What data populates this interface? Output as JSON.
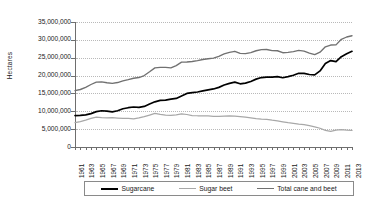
{
  "chart_data": {
    "type": "line",
    "title": "",
    "xlabel": "",
    "ylabel": "Hectares",
    "ylim": [
      0,
      35000000
    ],
    "xlim": [
      1961,
      2013
    ],
    "grid": true,
    "legend_position": "bottom",
    "y_ticks": [
      "35,000,000",
      "30,000,000",
      "25,000,000",
      "20,000,000",
      "15,000,000",
      "10,000,000",
      "5,000,000",
      "0"
    ],
    "y_tick_values": [
      35000000,
      30000000,
      25000000,
      20000000,
      15000000,
      10000000,
      5000000,
      0
    ],
    "x_tick_labels": [
      "1961",
      "1963",
      "1965",
      "1967",
      "1969",
      "1971",
      "1973",
      "1975",
      "1977",
      "1979",
      "1981",
      "1983",
      "1985",
      "1987",
      "1989",
      "1991",
      "1993",
      "1995",
      "1997",
      "1999",
      "2001",
      "2003",
      "2005",
      "2007",
      "2009",
      "2011",
      "2013"
    ],
    "x": [
      1961,
      1962,
      1963,
      1964,
      1965,
      1966,
      1967,
      1968,
      1969,
      1970,
      1971,
      1972,
      1973,
      1974,
      1975,
      1976,
      1977,
      1978,
      1979,
      1980,
      1981,
      1982,
      1983,
      1984,
      1985,
      1986,
      1987,
      1988,
      1989,
      1990,
      1991,
      1992,
      1993,
      1994,
      1995,
      1996,
      1997,
      1998,
      1999,
      2000,
      2001,
      2002,
      2003,
      2004,
      2005,
      2006,
      2007,
      2008,
      2009,
      2010,
      2011,
      2012,
      2013
    ],
    "series": [
      {
        "name": "Sugarcane",
        "color": "#000000",
        "values": [
          8800000,
          8850000,
          9000000,
          9350000,
          9900000,
          10150000,
          10050000,
          9850000,
          10150000,
          10700000,
          11000000,
          11200000,
          11100000,
          11350000,
          12050000,
          12650000,
          13050000,
          13150000,
          13400000,
          13600000,
          14300000,
          15000000,
          15250000,
          15400000,
          15700000,
          16000000,
          16250000,
          16700000,
          17350000,
          17800000,
          18150000,
          17700000,
          17900000,
          18350000,
          19000000,
          19450000,
          19550000,
          19550000,
          19700000,
          19400000,
          19700000,
          20100000,
          20650000,
          20600000,
          20300000,
          20200000,
          21300000,
          23400000,
          24200000,
          23900000,
          25300000,
          26100000,
          26800000
        ]
      },
      {
        "name": "Sugar beet",
        "color": "#a8a8a8",
        "values": [
          6800000,
          7100000,
          7500000,
          8000000,
          8350000,
          8200000,
          8150000,
          8200000,
          8100000,
          8000000,
          8000000,
          7900000,
          8150000,
          8500000,
          8950000,
          9400000,
          9150000,
          8950000,
          8850000,
          9000000,
          9250000,
          9100000,
          8800000,
          8750000,
          8750000,
          8700000,
          8600000,
          8600000,
          8650000,
          8700000,
          8650000,
          8500000,
          8350000,
          8150000,
          7950000,
          7800000,
          7750000,
          7500000,
          7300000,
          7050000,
          6800000,
          6600000,
          6400000,
          6250000,
          6000000,
          5650000,
          5250000,
          4650000,
          4350000,
          4700000,
          4850000,
          4700000,
          4650000
        ]
      },
      {
        "name": "Total cane and beet",
        "color": "#717171",
        "values": [
          15800000,
          16100000,
          16700000,
          17500000,
          18150000,
          18250000,
          18000000,
          17800000,
          18050000,
          18500000,
          18850000,
          19250000,
          19450000,
          20000000,
          21050000,
          22150000,
          22300000,
          22300000,
          22150000,
          22800000,
          23750000,
          23800000,
          23950000,
          24200000,
          24500000,
          24700000,
          24900000,
          25400000,
          26050000,
          26500000,
          26800000,
          26200000,
          26150000,
          26450000,
          26950000,
          27250000,
          27300000,
          27000000,
          26950000,
          26400000,
          26500000,
          26700000,
          27050000,
          26850000,
          26300000,
          25850000,
          26550000,
          28050000,
          28550000,
          28600000,
          30150000,
          30800000,
          31150000
        ]
      }
    ]
  },
  "legend": {
    "items": [
      {
        "label": "Sugarcane"
      },
      {
        "label": "Sugar beet"
      },
      {
        "label": "Total cane and beet"
      }
    ]
  }
}
